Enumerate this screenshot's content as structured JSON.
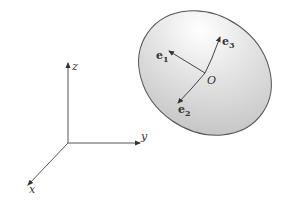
{
  "diagram": {
    "colors": {
      "line": "#444444",
      "ellipse_fill_light": "#ffffff",
      "ellipse_fill_dark": "#c8c8c8",
      "ellipse_stroke": "#555555",
      "text": "#333333"
    },
    "global_axes": {
      "x_label": "x",
      "y_label": "y",
      "z_label": "z"
    },
    "body": {
      "origin_label": "O",
      "vectors": [
        {
          "name": "e",
          "sub": "1"
        },
        {
          "name": "e",
          "sub": "2"
        },
        {
          "name": "e",
          "sub": "3"
        }
      ]
    }
  }
}
